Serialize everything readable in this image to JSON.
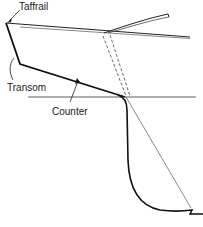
{
  "diagram": {
    "labels": {
      "taffrail": "Taffrail",
      "transom": "Transom",
      "counter": "Counter"
    },
    "colors": {
      "stroke": "#111111",
      "thin": "#333333",
      "background": "#ffffff"
    }
  }
}
